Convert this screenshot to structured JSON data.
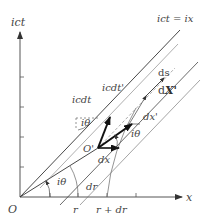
{
  "diagram": {
    "axes": {
      "x_label": "x",
      "y_label": "ict",
      "origin_label": "O"
    },
    "lines": {
      "light_line_label": "ict = ix"
    },
    "points": {
      "o_prime_label": "O'"
    },
    "vectors": {
      "icdt_label": "icdt",
      "icdt_prime_label": "icdt'",
      "dx_label": "dx",
      "dx_prime_label": "dx'",
      "ds_label": "ds",
      "dX_prime_d": "d",
      "dX_prime_X": "X'"
    },
    "angles": {
      "angle_origin": "iθ",
      "angle_upper": "iθ",
      "angle_right": "iθ"
    },
    "radii": {
      "r_label": "r",
      "r_plus_dr_label": "r + dr",
      "dr_label": "dr"
    },
    "colors": {
      "axis": "#555555",
      "line": "#333333",
      "light_line": "#999999",
      "vector": "#111111"
    }
  }
}
